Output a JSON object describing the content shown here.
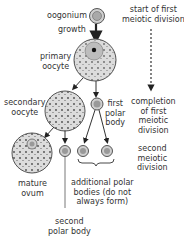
{
  "labels": {
    "oogonium": "oogonium",
    "growth": "growth",
    "primary_oocyte": [
      "primary",
      "oocyte"
    ],
    "secondary_oocyte": [
      "secondary",
      "oocyte"
    ],
    "first_polar_body": [
      "first",
      "polar",
      "body"
    ],
    "mature_ovum": [
      "mature",
      "ovum"
    ],
    "second_polar_body": [
      "second",
      "polar body"
    ],
    "additional_polar_bodies": [
      "additional polar",
      "bodies (do not",
      "always form)"
    ]
  },
  "stages": {
    "start_first": [
      "start of first",
      "meiotic division"
    ],
    "completion_first": [
      "completion",
      "of first",
      "meiotic",
      "division"
    ],
    "second_division": [
      "second",
      "meiotic",
      "division"
    ]
  },
  "colors": {
    "cell_fill": "#cfcfcf",
    "cell_stroke": "#555555",
    "nucleus_fill": "#a9a9a9",
    "granule": "#4a4a4a",
    "line": "#333333"
  }
}
